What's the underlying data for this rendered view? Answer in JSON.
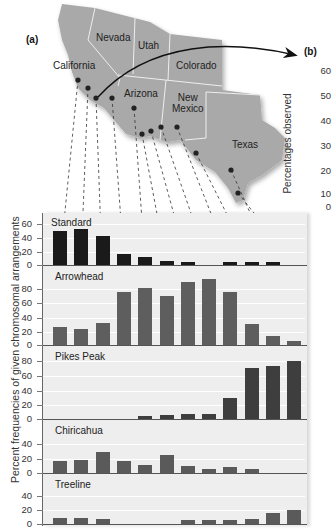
{
  "figure": {
    "panel_a_label": "(a)",
    "panel_b_label": "(b)"
  },
  "map": {
    "states": [
      {
        "name": "California"
      },
      {
        "name": "Nevada"
      },
      {
        "name": "Utah"
      },
      {
        "name": "Colorado"
      },
      {
        "name": "Arizona"
      },
      {
        "name": "New Mexico",
        "line1": "New",
        "line2": "Mexico"
      },
      {
        "name": "Texas"
      }
    ],
    "sample_points": 12
  },
  "side_axis": {
    "label": "Percentages observed",
    "ticks": [
      "60",
      "50",
      "40",
      "30",
      "20",
      "10",
      "0"
    ]
  },
  "chart_data": {
    "type": "bar",
    "title": "",
    "xlabel": "",
    "ylabel": "Percent frequencies of given chromosomal arrangements",
    "categories": [
      "1",
      "2",
      "3",
      "4",
      "5",
      "6",
      "7",
      "8",
      "9",
      "10",
      "11",
      "12"
    ],
    "series": [
      {
        "name": "Standard",
        "color": "#1a1a1a",
        "ylim": [
          0,
          60
        ],
        "ticks": [
          "60",
          "40",
          "20",
          "0"
        ],
        "values": [
          49,
          52,
          42,
          16,
          12,
          6,
          5,
          0,
          5,
          5,
          5,
          0
        ]
      },
      {
        "name": "Arrowhead",
        "color": "#5e5e5e",
        "ylim": [
          0,
          100
        ],
        "ticks": [
          "80",
          "60",
          "40",
          "20",
          "0"
        ],
        "values": [
          26,
          23,
          31,
          74,
          80,
          69,
          89,
          93,
          74,
          30,
          13,
          5
        ]
      },
      {
        "name": "Pikes Peak",
        "color": "#3e3e3e",
        "ylim": [
          0,
          90
        ],
        "ticks": [
          "80",
          "60",
          "40",
          "20",
          "0"
        ],
        "values": [
          0,
          0,
          0,
          0,
          4,
          5,
          7,
          7,
          28,
          69,
          71,
          79
        ]
      },
      {
        "name": "Chiricahua",
        "color": "#5a5a5a",
        "ylim": [
          0,
          50
        ],
        "ticks": [
          "40",
          "20",
          "0"
        ],
        "values": [
          16,
          18,
          29,
          16,
          11,
          25,
          9,
          5,
          8,
          6,
          0,
          0
        ]
      },
      {
        "name": "Treeline",
        "color": "#5a5a5a",
        "ylim": [
          0,
          50
        ],
        "ticks": [
          "40",
          "20",
          "0"
        ],
        "values": [
          8,
          8,
          7,
          0,
          0,
          0,
          5,
          5,
          5,
          7,
          15,
          20
        ]
      }
    ]
  }
}
